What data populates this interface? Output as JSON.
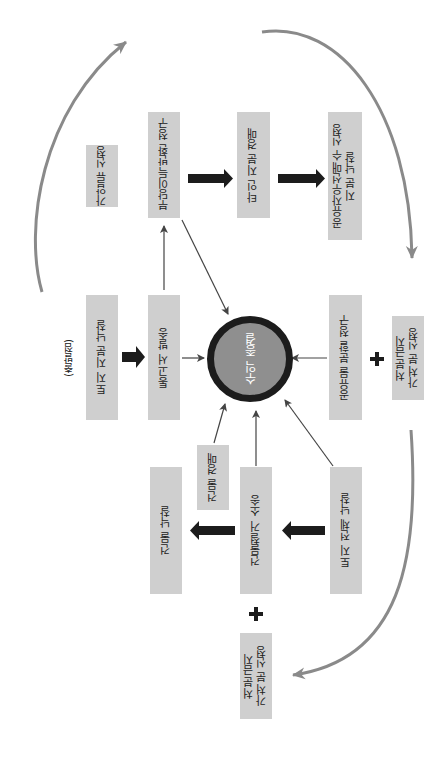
{
  "diagram": {
    "orientation": "rotated-90-ccw",
    "start_label": "(출발점)",
    "center": {
      "label": "수익 종결",
      "fill": "#8f8f8f",
      "ring": "#1c1c1c"
    },
    "nodes": {
      "provisional_seizure": "가압류 신청",
      "unjust_enrichment": "부당이득반환 청구",
      "other_share_auction": "타인 지분 경매",
      "co_owner_preemption": "공유자우선매수 신청\n지분 낙찰",
      "land_share_bid": "토지 지분 낙찰",
      "notice_sent": "통고서 발송",
      "partition_claim": "공유물 분할 청구",
      "injunction_right": "처분금지\n가처분 신청",
      "building_auction": "건물 경매",
      "building_bid": "건물 낙찰",
      "demolition_suit": "건물철거 소송",
      "whole_land_bid": "토지 전체 낙찰",
      "injunction_bottom": "처분금지\n가처분 신청"
    },
    "colors": {
      "box": "#cfcfcf",
      "thick_arrow": "#1c1c1c",
      "thin_arrow": "#444444",
      "curve_arrow": "#8a8a8a"
    }
  }
}
